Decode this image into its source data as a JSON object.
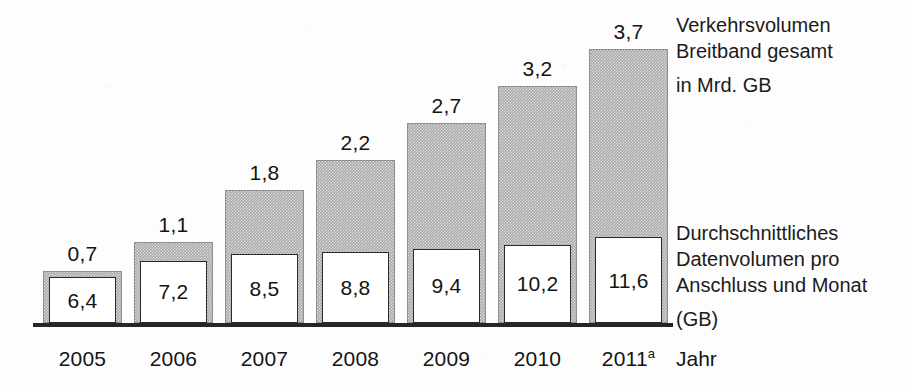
{
  "chart_data": {
    "type": "bar",
    "title": "",
    "xlabel": "Jahr",
    "ylabel": "",
    "grid": false,
    "legend_position": "right",
    "categories": [
      "2005",
      "2006",
      "2007",
      "2008",
      "2009",
      "2010",
      "2011a"
    ],
    "category_labels": [
      "2005",
      "2006",
      "2007",
      "2008",
      "2009",
      "2010",
      "2011"
    ],
    "category_superscripts": [
      "",
      "",
      "",
      "",
      "",
      "",
      "a"
    ],
    "ylim": [
      0,
      4.0
    ],
    "series": [
      {
        "name": "Verkehrsvolumen Breitband gesamt in Mrd. GB",
        "unit": "Mrd. GB",
        "render": "bar-outer",
        "values": [
          0.7,
          1.1,
          1.8,
          2.2,
          2.7,
          3.2,
          3.7
        ],
        "labels": [
          "0,7",
          "1,1",
          "1,8",
          "2,2",
          "2,7",
          "3,2",
          "3,7"
        ]
      },
      {
        "name": "Durchschnittliches Datenvolumen pro Anschluss und Monat (GB)",
        "unit": "GB",
        "render": "inner-box",
        "values": [
          6.4,
          7.2,
          8.5,
          8.8,
          9.4,
          10.2,
          11.6
        ],
        "labels": [
          "6,4",
          "7,2",
          "8,5",
          "8,8",
          "9,4",
          "10,2",
          "11,6"
        ]
      }
    ],
    "colors": {
      "bar_fill": "#a9a9a9",
      "bar_border": "#8f8f8f",
      "inner_fill": "#ffffff",
      "inner_border": "#2a2a2a",
      "axis": "#262626",
      "text": "#141414",
      "background": "#ffffff"
    }
  },
  "legends": {
    "total_volume": {
      "lines": [
        "Verkehrsvolumen",
        "Breitband gesamt",
        "in Mrd. GB"
      ]
    },
    "average_volume": {
      "lines": [
        "Durchschnittliches",
        "Datenvolumen pro",
        "Anschluss und Monat",
        "(GB)"
      ]
    }
  },
  "axis": {
    "x_title": "Jahr"
  }
}
